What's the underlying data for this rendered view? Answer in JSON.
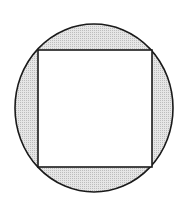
{
  "diagram": {
    "colors": {
      "background": "#ffffff",
      "shaded_fill": "#d9d9d9",
      "square_fill": "#ffffff",
      "stroke": "#1a1a1a"
    },
    "circle": {
      "cx": 94,
      "cy": 108,
      "rx": 79,
      "ry": 84
    },
    "square": {
      "x": 38,
      "y": 50,
      "width": 114,
      "height": 117
    }
  }
}
